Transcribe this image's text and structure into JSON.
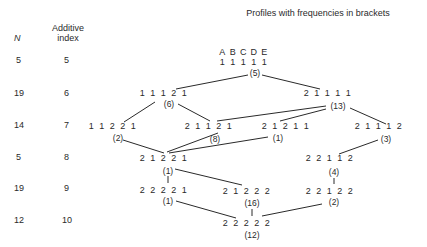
{
  "title": "Profiles with frequencies in brackets",
  "columns": {
    "n_label": "N",
    "index_label_1": "Additive",
    "index_label_2": "index"
  },
  "attribute_labels": [
    "A",
    "B",
    "C",
    "D",
    "E"
  ],
  "rows": [
    {
      "n": "5",
      "index": "5"
    },
    {
      "n": "19",
      "index": "6"
    },
    {
      "n": "14",
      "index": "7"
    },
    {
      "n": "5",
      "index": "8"
    },
    {
      "n": "19",
      "index": "9"
    },
    {
      "n": "12",
      "index": "10"
    }
  ],
  "nodes": [
    {
      "id": "11111",
      "profile": [
        "1",
        "1",
        "1",
        "1",
        "1"
      ],
      "freq": "(5)"
    },
    {
      "id": "11121",
      "profile": [
        "1",
        "1",
        "1",
        "2",
        "1"
      ],
      "freq": "(6)"
    },
    {
      "id": "21111",
      "profile": [
        "2",
        "1",
        "1",
        "1",
        "1"
      ],
      "freq": "(13)"
    },
    {
      "id": "11221",
      "profile": [
        "1",
        "1",
        "2",
        "2",
        "1"
      ],
      "freq": "(2)"
    },
    {
      "id": "21121",
      "profile": [
        "2",
        "1",
        "1",
        "2",
        "1"
      ],
      "freq": "(8)"
    },
    {
      "id": "21211",
      "profile": [
        "2",
        "1",
        "2",
        "1",
        "1"
      ],
      "freq": "(1)"
    },
    {
      "id": "21112",
      "profile": [
        "2",
        "1",
        "1",
        "1",
        "2"
      ],
      "freq": "(3)"
    },
    {
      "id": "21221",
      "profile": [
        "2",
        "1",
        "2",
        "2",
        "1"
      ],
      "freq": "(1)"
    },
    {
      "id": "22112",
      "profile": [
        "2",
        "2",
        "1",
        "1",
        "2"
      ],
      "freq": "(4)"
    },
    {
      "id": "22221",
      "profile": [
        "2",
        "2",
        "2",
        "2",
        "1"
      ],
      "freq": "(1)"
    },
    {
      "id": "21222",
      "profile": [
        "2",
        "1",
        "2",
        "2",
        "2"
      ],
      "freq": "(16)"
    },
    {
      "id": "22122",
      "profile": [
        "2",
        "2",
        "1",
        "2",
        "2"
      ],
      "freq": "(2)"
    },
    {
      "id": "22222",
      "profile": [
        "2",
        "2",
        "2",
        "2",
        "2"
      ],
      "freq": "(12)"
    }
  ]
}
